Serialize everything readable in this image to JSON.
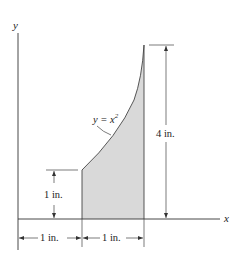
{
  "diagram": {
    "axes": {
      "x_label": "x",
      "y_label": "y"
    },
    "curve_label": {
      "base": "y = x",
      "exponent": "2"
    },
    "dimensions": {
      "height_left": "1 in.",
      "height_right": "4 in.",
      "width_first": "1 in.",
      "width_second": "1 in."
    },
    "colors": {
      "fill": "#d9d9d9",
      "line": "#333333"
    }
  }
}
